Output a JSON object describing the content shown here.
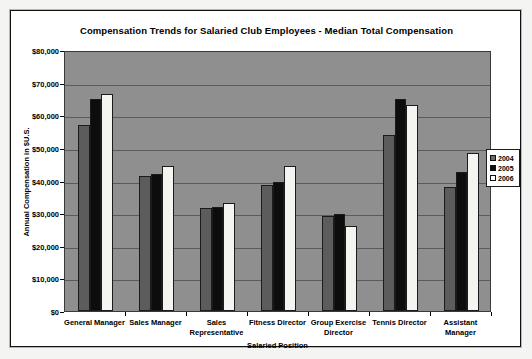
{
  "chart_data": {
    "type": "bar",
    "title": "Compensation Trends for Salaried Club Employees - Median Total Compensation",
    "xlabel": "Salaried Position",
    "ylabel": "Annual Compensation in $U.S.",
    "ylim": [
      0,
      80000
    ],
    "ytick_values": [
      0,
      10000,
      20000,
      30000,
      40000,
      50000,
      60000,
      70000,
      80000
    ],
    "ytick_labels": [
      "$0",
      "$10,000",
      "$20,000",
      "$30,000",
      "$40,000",
      "$50,000",
      "$60,000",
      "$70,000",
      "$80,000"
    ],
    "grid": true,
    "legend_position": "right",
    "categories": [
      "General Manager",
      "Sales Manager",
      "Sales Representative",
      "Fitness Director",
      "Group Exercise Director",
      "Tennis Director",
      "Assistant Manager"
    ],
    "series": [
      {
        "name": "2004",
        "color": "#5c5c5c",
        "values": [
          57000,
          41500,
          31500,
          38500,
          29000,
          54000,
          38000
        ]
      },
      {
        "name": "2005",
        "color": "#0d0d0d",
        "values": [
          65000,
          42000,
          32000,
          39500,
          29800,
          65000,
          42500
        ]
      },
      {
        "name": "2006",
        "color": "#f4f4f0",
        "values": [
          66500,
          44500,
          33000,
          44500,
          26200,
          63000,
          48500
        ]
      }
    ]
  },
  "legend": {
    "items": [
      {
        "label": "2004"
      },
      {
        "label": "2005"
      },
      {
        "label": "2006"
      }
    ]
  }
}
